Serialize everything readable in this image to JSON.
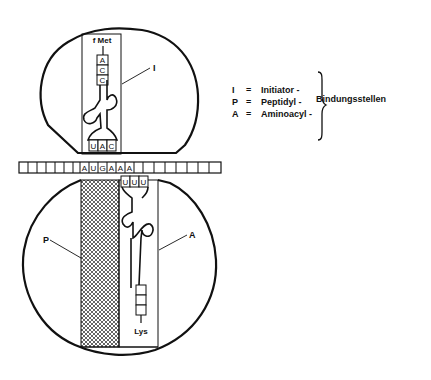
{
  "diagram": {
    "type": "ribosome-translation-initiation",
    "colors": {
      "line": "#111111",
      "background": "#ffffff"
    },
    "small_subunit": {
      "site_label": "I",
      "trna": {
        "amino_acid": "f Met",
        "acceptor_stem": [
          "A",
          "C",
          "C"
        ],
        "anticodon": [
          "U",
          "A",
          "C"
        ]
      }
    },
    "mrna": {
      "codons_shown": [
        "A",
        "U",
        "G",
        "A",
        "A",
        "A"
      ],
      "blank_left": 8,
      "blank_right": 7
    },
    "large_subunit": {
      "p_label": "P",
      "a_label": "A",
      "trna": {
        "amino_acid": "Lys",
        "anticodon": [
          "U",
          "U",
          "U"
        ]
      }
    },
    "legend": {
      "items": [
        {
          "key": "I",
          "eq": "=",
          "text": "Initiator -"
        },
        {
          "key": "P",
          "eq": "=",
          "text": "Peptidyl -"
        },
        {
          "key": "A",
          "eq": "=",
          "text": "Aminoacyl -"
        }
      ],
      "group_label": "Bindungsstellen"
    }
  }
}
